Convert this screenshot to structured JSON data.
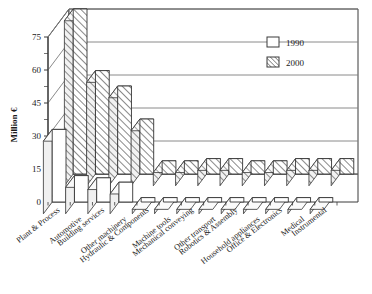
{
  "chart_data": {
    "type": "bar",
    "title": "",
    "subtitle": "",
    "xlabel": "",
    "ylabel": "Million €",
    "ylim": [
      0,
      75
    ],
    "yticks": [
      0,
      15,
      30,
      45,
      60,
      75
    ],
    "grid": true,
    "legend_position": "top-right",
    "style": "3d-bar",
    "categories": [
      "Plant & Process",
      "Automotive",
      "Building services",
      "Other machinery",
      "Hydraulic & Components",
      "Machine tools",
      "Mechanical conveying",
      "Other transport",
      "Robotics & Assembly",
      "Household appliances",
      "Office & Electronics",
      "Medical",
      "Instrumental"
    ],
    "series": [
      {
        "name": "1990",
        "fill": "white",
        "values": [
          33,
          12,
          11,
          9,
          2,
          2,
          2,
          2,
          2,
          2,
          2,
          2,
          2
        ]
      },
      {
        "name": "2000",
        "fill": "hatched",
        "values": [
          75,
          47,
          40,
          25,
          6,
          6,
          7,
          7,
          6,
          6,
          7,
          7,
          7
        ]
      }
    ]
  },
  "legend": {
    "entries": [
      {
        "label": "1990",
        "swatch": "empty-square-swatch"
      },
      {
        "label": "2000",
        "swatch": "hatched-square-swatch"
      }
    ]
  },
  "axis": {
    "y_title": "Million €",
    "ticks": [
      "0",
      "15",
      "30",
      "45",
      "60",
      "75"
    ]
  },
  "colors": {
    "line": "#3a3a3a",
    "grid": "#8a8a8a",
    "fill_1990": "#ffffff",
    "fill_2000_base": "#ffffff",
    "hatch": "#4a4a4a",
    "side_face": "#f0f0f0",
    "top_face": "#fafafa"
  }
}
